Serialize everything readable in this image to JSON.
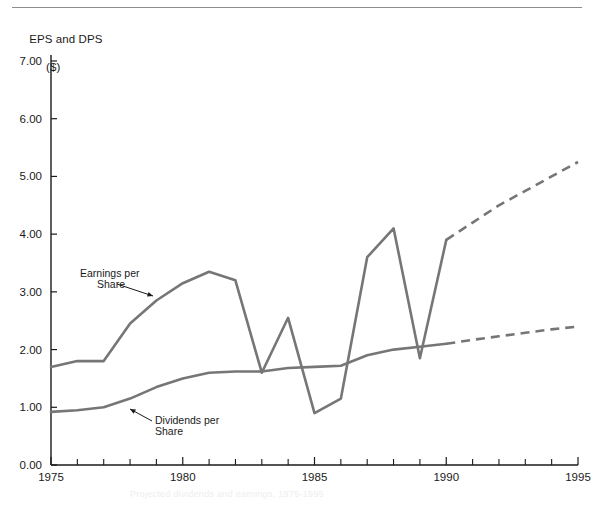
{
  "figure": {
    "y_axis_title_line1": "EPS and DPS",
    "y_axis_title_line2": "($)",
    "bottom_faint_note": "Projected dividends and earnings, 1975-1995"
  },
  "colors": {
    "line": "#767676",
    "axis": "#1a1a1a",
    "rule": "#8d8d8d",
    "annotation": "#1a1a1a"
  },
  "annotations": {
    "eps_label_line1": "Earnings per",
    "eps_label_line2": "Share",
    "dps_label_line1": "Dividends per",
    "dps_label_line2": "Share"
  },
  "axes": {
    "y_ticks": [
      "0.00",
      "1.00",
      "2.00",
      "3.00",
      "4.00",
      "5.00",
      "6.00",
      "7.00"
    ],
    "x_ticks_labeled": [
      "1975",
      "1980",
      "1985",
      "1990",
      "1995"
    ],
    "x_minor_years": [
      1976,
      1977,
      1978,
      1979,
      1981,
      1982,
      1983,
      1984,
      1986,
      1987,
      1988,
      1989,
      1991,
      1992,
      1993,
      1994
    ]
  },
  "chart_data": {
    "type": "line",
    "title": "EPS and DPS ($)",
    "xlabel": "",
    "ylabel": "EPS and DPS ($)",
    "xlim": [
      1975,
      1995
    ],
    "ylim": [
      0.0,
      7.0
    ],
    "ytick_step": 1.0,
    "grid": false,
    "legend": "inline-annotations",
    "x": [
      1975,
      1976,
      1977,
      1978,
      1979,
      1980,
      1981,
      1982,
      1983,
      1984,
      1985,
      1986,
      1987,
      1988,
      1989,
      1990,
      1991,
      1992,
      1993,
      1994,
      1995
    ],
    "series": [
      {
        "name": "Earnings per Share",
        "style": "solid-then-dashed",
        "actual_through": 1990,
        "values": [
          1.7,
          1.8,
          1.8,
          2.45,
          2.85,
          3.15,
          3.35,
          3.2,
          1.6,
          2.55,
          0.9,
          1.15,
          3.6,
          4.1,
          1.85,
          3.9,
          4.2,
          4.5,
          4.75,
          5.0,
          5.25
        ]
      },
      {
        "name": "Dividends per Share",
        "style": "solid-then-dashed",
        "actual_through": 1990,
        "values": [
          0.92,
          0.95,
          1.0,
          1.15,
          1.35,
          1.5,
          1.6,
          1.62,
          1.62,
          1.68,
          1.7,
          1.72,
          1.9,
          2.0,
          2.05,
          2.1,
          2.17,
          2.23,
          2.29,
          2.35,
          2.4
        ]
      }
    ]
  }
}
